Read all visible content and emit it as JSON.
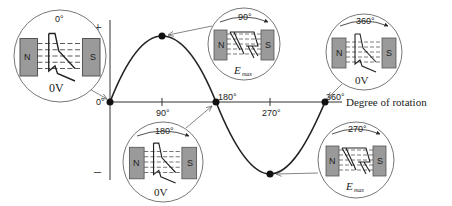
{
  "figure": {
    "axis": {
      "y_label": "V",
      "y_plus": "+",
      "y_minus": "–",
      "x_label": "Degree of rotation",
      "ticks": [
        "0°",
        "90°",
        "180°",
        "270°",
        "360°"
      ]
    },
    "insets": [
      {
        "id": "0",
        "angle_label": "0°",
        "output_label": "0V",
        "pole_left": "N",
        "pole_right": "S",
        "coil": "parallel"
      },
      {
        "id": "90",
        "angle_label": "90°",
        "output_label": "E",
        "output_sub": "max",
        "pole_left": "N",
        "pole_right": "S",
        "coil": "perpendicular"
      },
      {
        "id": "180",
        "angle_label": "180°",
        "output_label": "0V",
        "pole_left": "N",
        "pole_right": "S",
        "coil": "parallel"
      },
      {
        "id": "270",
        "angle_label": "270°",
        "output_label": "E",
        "output_sub": "max",
        "pole_left": "N",
        "pole_right": "S",
        "coil": "perpendicular"
      },
      {
        "id": "360",
        "angle_label": "360°",
        "output_label": "0V",
        "pole_left": "N",
        "pole_right": "S",
        "coil": "parallel"
      }
    ],
    "colors": {
      "line": "#222222",
      "pole_fill": "#9a9a9a",
      "circle_fill": "#ffffff",
      "arrow": "#777777"
    }
  }
}
